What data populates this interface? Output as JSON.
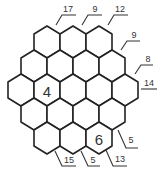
{
  "puzzle": {
    "type": "hexagonal-sum-puzzle",
    "rows": [
      {
        "y": 42,
        "cells": [
          {
            "x": 47,
            "value": ""
          },
          {
            "x": 73,
            "value": ""
          },
          {
            "x": 99,
            "value": ""
          }
        ]
      },
      {
        "y": 66,
        "cells": [
          {
            "x": 34,
            "value": ""
          },
          {
            "x": 60,
            "value": ""
          },
          {
            "x": 86,
            "value": ""
          },
          {
            "x": 112,
            "value": ""
          }
        ]
      },
      {
        "y": 90,
        "cells": [
          {
            "x": 21,
            "value": ""
          },
          {
            "x": 47,
            "value": "4"
          },
          {
            "x": 73,
            "value": ""
          },
          {
            "x": 99,
            "value": ""
          },
          {
            "x": 125,
            "value": ""
          }
        ]
      },
      {
        "y": 114,
        "cells": [
          {
            "x": 34,
            "value": ""
          },
          {
            "x": 60,
            "value": ""
          },
          {
            "x": 86,
            "value": ""
          },
          {
            "x": 112,
            "value": ""
          }
        ]
      },
      {
        "y": 138,
        "cells": [
          {
            "x": 47,
            "value": ""
          },
          {
            "x": 73,
            "value": ""
          },
          {
            "x": 99,
            "value": "6"
          }
        ]
      }
    ],
    "clues": [
      {
        "label": "17",
        "side": "top",
        "line": [
          [
            56,
            25
          ],
          [
            62,
            15
          ],
          [
            76,
            15
          ]
        ],
        "tx": 68,
        "ty": 12
      },
      {
        "label": "9",
        "side": "top",
        "line": [
          [
            82,
            25
          ],
          [
            88,
            15
          ],
          [
            102,
            15
          ]
        ],
        "tx": 95,
        "ty": 12
      },
      {
        "label": "12",
        "side": "top",
        "line": [
          [
            108,
            25
          ],
          [
            114,
            15
          ],
          [
            128,
            15
          ]
        ],
        "tx": 120,
        "ty": 12
      },
      {
        "label": "9",
        "side": "right",
        "line": [
          [
            121,
            50
          ],
          [
            127,
            41
          ],
          [
            140,
            41
          ]
        ],
        "tx": 134,
        "ty": 38
      },
      {
        "label": "8",
        "side": "right",
        "line": [
          [
            135,
            74
          ],
          [
            141,
            65
          ],
          [
            153,
            65
          ]
        ],
        "tx": 148,
        "ty": 62
      },
      {
        "label": "14",
        "side": "right",
        "line": [
          [
            141,
            89
          ],
          [
            157,
            89
          ]
        ],
        "tx": 149,
        "ty": 86
      },
      {
        "label": "5",
        "side": "bottom-right",
        "line": [
          [
            118,
            130
          ],
          [
            126,
            148
          ],
          [
            138,
            148
          ]
        ],
        "tx": 131,
        "ty": 143
      },
      {
        "label": "13",
        "side": "bottom-right",
        "line": [
          [
            106,
            150
          ],
          [
            113,
            166
          ],
          [
            127,
            166
          ]
        ],
        "tx": 120,
        "ty": 162
      },
      {
        "label": "5",
        "side": "bottom",
        "line": [
          [
            81,
            151
          ],
          [
            88,
            166
          ],
          [
            100,
            166
          ]
        ],
        "tx": 93,
        "ty": 163
      },
      {
        "label": "15",
        "side": "bottom",
        "line": [
          [
            55,
            151
          ],
          [
            62,
            166
          ],
          [
            76,
            166
          ]
        ],
        "tx": 69,
        "ty": 163
      }
    ],
    "hex": {
      "half_width": 13,
      "half_side": 8,
      "tip": 16
    },
    "colors": {
      "stroke": "#222222",
      "fill": "#ffffff",
      "text": "#333333"
    }
  }
}
